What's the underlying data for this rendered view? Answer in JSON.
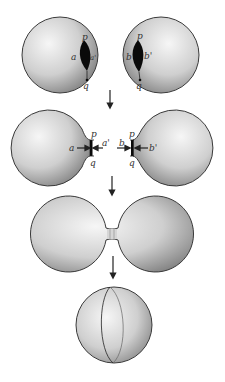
{
  "diagram": {
    "title": "",
    "stages": [
      {
        "id": "stage-1",
        "description": "Two separate spheres, each with a slit (hole) bounded by points p and q",
        "labels": {
          "left_sphere": {
            "p": "p",
            "q": "q",
            "left_edge": "a",
            "right_edge": "a'"
          },
          "right_sphere": {
            "p": "p",
            "q": "q",
            "left_edge": "b",
            "right_edge": "b'"
          }
        }
      },
      {
        "id": "stage-2",
        "description": "Holes pulled out into tubes; edges labeled with arrows pointing inward",
        "labels": {
          "left_sphere": {
            "p": "p",
            "q": "q",
            "outer": "a",
            "inner": "a'"
          },
          "right_sphere": {
            "p": "p",
            "q": "q",
            "outer": "b'",
            "inner": "b"
          }
        }
      },
      {
        "id": "stage-3",
        "description": "The two tubes are glued, joining the spheres with a narrow neck"
      },
      {
        "id": "stage-4",
        "description": "Resulting single sphere with a seam curve"
      }
    ],
    "colors": {
      "sphere_light": "#f4f4f4",
      "sphere_mid": "#c8c8c8",
      "sphere_dark": "#7a7a7a",
      "outline": "#3a3a3a",
      "hole": "#0a0a0a",
      "arrow": "#222222"
    }
  }
}
